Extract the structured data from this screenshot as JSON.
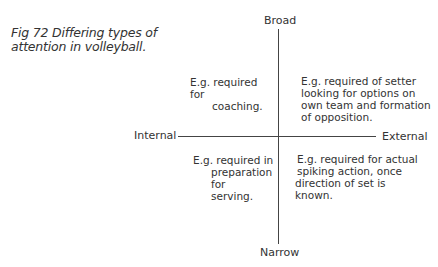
{
  "caption": {
    "line1": "Fig 72 Differing types of",
    "line2": "attention in volleyball."
  },
  "axes": {
    "top": "Broad",
    "bottom": "Narrow",
    "left": "Internal",
    "right": "External"
  },
  "quadrants": {
    "broad_internal": {
      "line1": "E.g. required for",
      "line2": "coaching."
    },
    "broad_external": {
      "line1": "E.g. required of setter",
      "line2": "looking for options on",
      "line3": "own team and formation",
      "line4": "of opposition."
    },
    "narrow_internal": {
      "line1": "E.g. required in",
      "line2": "preparation for",
      "line3": "serving."
    },
    "narrow_external": {
      "line1": "E.g. required for actual",
      "line2": "spiking action, once",
      "line3": "direction of set is",
      "line4": "known."
    }
  }
}
